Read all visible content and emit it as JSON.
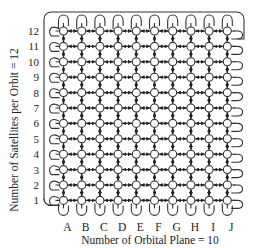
{
  "diagram": {
    "type": "satellite-constellation-grid-topology",
    "y_axis_title": "Number of Satellites per Orbit = 12",
    "x_axis_title": "Number of Orbital Plane = 10",
    "row_labels": [
      "1",
      "2",
      "3",
      "4",
      "5",
      "6",
      "7",
      "8",
      "9",
      "10",
      "11",
      "12"
    ],
    "column_labels": [
      "A",
      "B",
      "C",
      "D",
      "E",
      "F",
      "G",
      "H",
      "I",
      "J"
    ],
    "num_rows": 12,
    "num_columns": 10,
    "node_shape": "circle",
    "links": "bidirectional arrows between adjacent nodes, with wrap-around loops at grid edges",
    "colors": {
      "line": "#333333",
      "node_fill": "#ffffff",
      "text": "#222222",
      "background": "#ffffff"
    }
  }
}
